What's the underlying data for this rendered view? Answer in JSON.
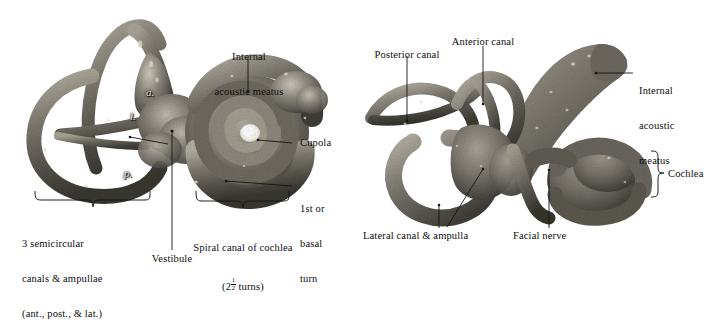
{
  "figure": {
    "panels": [
      {
        "id": "left",
        "view": "lateral view of right bony labyrinth",
        "specimen_letters": [
          {
            "id": "anterior",
            "text": "a."
          },
          {
            "id": "lateral",
            "text": "l."
          },
          {
            "id": "posterior",
            "text": "p."
          }
        ],
        "labels": {
          "internal_acoustic_meatus": {
            "line1": "Internal",
            "line2": "acoustic meatus"
          },
          "cupola": "Cupola",
          "basal_turn": {
            "line1": "1st or",
            "line2": "basal",
            "line3": "turn"
          },
          "semicircular_canals": {
            "line1": "3 semicircular",
            "line2": "canals & ampullae",
            "line3": "(ant., post., & lat.)"
          },
          "spiral_canal": {
            "line1": "Spiral canal of cochlea",
            "line2_prefix": "(2",
            "line2_numerator": "1",
            "line2_denominator": "2",
            "line2_suffix": " turns)"
          },
          "vestibule": "Vestibule"
        },
        "brackets": [
          {
            "id": "semicircular-canals-bracket",
            "direction": "down"
          },
          {
            "id": "spiral-canal-bracket",
            "direction": "down"
          }
        ]
      },
      {
        "id": "right",
        "view": "posterolateral view of right bony labyrinth",
        "labels": {
          "posterior_canal": "Posterior canal",
          "anterior_canal": "Anterior canal",
          "internal_acoustic_meatus": {
            "line1": "Internal",
            "line2": "acoustic",
            "line3": "meatus"
          },
          "cochlea": "Cochlea",
          "lateral_canal_ampulla": "Lateral canal & ampulla",
          "facial_nerve": "Facial nerve"
        },
        "brackets": [
          {
            "id": "cochlea-bracket",
            "direction": "right"
          }
        ]
      }
    ]
  },
  "colors": {
    "background": "#ffffff",
    "text": "#0d0d0d",
    "leader_line": "#151515",
    "specimen_dark": "#3b3a36",
    "specimen_mid": "#7d7a71",
    "specimen_light": "#b9b5aa",
    "specimen_highlight": "#e6e2d7",
    "cupola_white": "#fdfdfb"
  }
}
